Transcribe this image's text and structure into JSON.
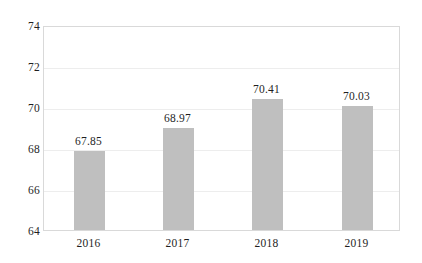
{
  "chart_data": {
    "type": "bar",
    "title": "",
    "xlabel": "",
    "ylabel": "",
    "categories": [
      "2016",
      "2017",
      "2018",
      "2019"
    ],
    "values": [
      67.85,
      68.97,
      70.41,
      70.03
    ],
    "data_labels": [
      "67.85",
      "68.97",
      "70.41",
      "70.03"
    ],
    "ylim": [
      64,
      74
    ],
    "yticks": [
      64,
      66,
      68,
      70,
      72,
      74
    ],
    "ytick_labels": [
      "64",
      "66",
      "68",
      "70",
      "72",
      "74"
    ],
    "grid": "horizontal",
    "legend": "none",
    "series": [
      {
        "name": "",
        "values": [
          67.85,
          68.97,
          70.41,
          70.03
        ],
        "color": "#bfbfbf"
      }
    ]
  },
  "style": {
    "bar_color": "#bfbfbf",
    "gridline_color": "#ededed",
    "plot_border_color": "#d9d9d9",
    "text_color": "#1f1f1f",
    "background": "#ffffff"
  }
}
